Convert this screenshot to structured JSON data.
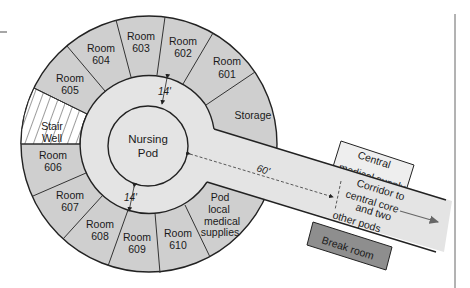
{
  "diagram": {
    "type": "floor-plan",
    "colors": {
      "background": "#ffffff",
      "room_fill": "#cfcfcf",
      "corridor_fill": "#e4e4e4",
      "pod_fill": "#e4e4e4",
      "central_supply_fill": "#eeeeee",
      "break_room_fill": "#8e8e8e",
      "stroke": "#222222",
      "arrow": "#555555"
    },
    "rooms": [
      {
        "id": "room-601",
        "line1": "Room",
        "line2": "601"
      },
      {
        "id": "room-602",
        "line1": "Room",
        "line2": "602"
      },
      {
        "id": "room-603",
        "line1": "Room",
        "line2": "603"
      },
      {
        "id": "room-604",
        "line1": "Room",
        "line2": "604"
      },
      {
        "id": "room-605",
        "line1": "Room",
        "line2": "605"
      },
      {
        "id": "room-606",
        "line1": "Room",
        "line2": "606"
      },
      {
        "id": "room-607",
        "line1": "Room",
        "line2": "607"
      },
      {
        "id": "room-608",
        "line1": "Room",
        "line2": "608"
      },
      {
        "id": "room-609",
        "line1": "Room",
        "line2": "609"
      },
      {
        "id": "room-610",
        "line1": "Room",
        "line2": "610"
      }
    ],
    "stair_well": {
      "line1": "Stair",
      "line2": "Well"
    },
    "storage": {
      "label": "Storage"
    },
    "pod_supplies": {
      "line1": "Pod",
      "line2": "local",
      "line3": "medical",
      "line4": "supplies"
    },
    "nursing_pod": {
      "line1": "Nursing",
      "line2": "Pod"
    },
    "dimensions": {
      "ring_width_top": "14'",
      "ring_width_bottom": "14'",
      "corridor_length": "60'"
    },
    "central_supply": {
      "line1": "Central",
      "line2": "medical supply"
    },
    "corridor": {
      "line1": "Corridor to",
      "line2": "central core",
      "line3": "and two",
      "line4": "other pods"
    },
    "break_room": {
      "label": "Break room"
    }
  }
}
